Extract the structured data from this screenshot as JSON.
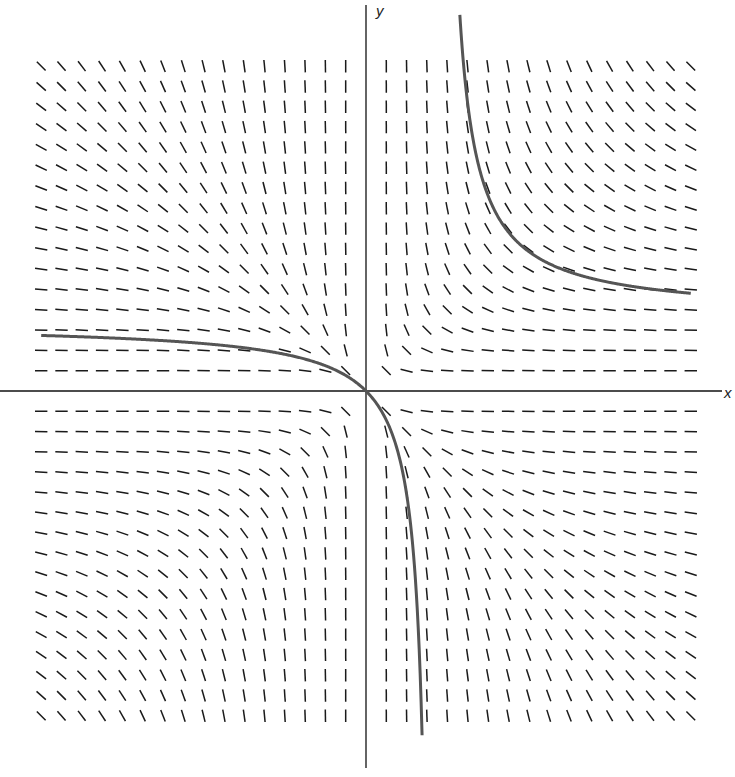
{
  "chart_data": {
    "type": "slope_field",
    "title": "",
    "xlabel": "x",
    "ylabel": "y",
    "differential_equation": "dy/dx = -y^2/x^2",
    "grid": {
      "x_values": [
        -16,
        -15,
        -14,
        -13,
        -12,
        -11,
        -10,
        -9,
        -8,
        -7,
        -6,
        -5,
        -4,
        -3,
        -2,
        -1,
        1,
        2,
        3,
        4,
        5,
        6,
        7,
        8,
        9,
        10,
        11,
        12,
        13,
        14,
        15,
        16
      ],
      "y_values": [
        -16,
        -15,
        -14,
        -13,
        -12,
        -11,
        -10,
        -9,
        -8,
        -7,
        -6,
        -5,
        -4,
        -3,
        -2,
        -1,
        1,
        2,
        3,
        4,
        5,
        6,
        7,
        8,
        9,
        10,
        11,
        12,
        13,
        14,
        15,
        16
      ],
      "note": "grid in equal step units on both axes; no tick labels shown"
    },
    "xlim": [
      -18,
      18.5
    ],
    "ylim": [
      -18.5,
      19
    ],
    "series": [
      {
        "name": "solution through origin",
        "formula": "y = a*x/(x-a)",
        "a": 3.3,
        "x_range": [
          -16,
          3.0
        ],
        "description": "approaches y≈3 as x→-∞, passes through origin, drops steeply toward vertical asymptote x≈3.3"
      },
      {
        "name": "upper-right solution",
        "formula": "y = b*x/(x-b)",
        "b": 3.7,
        "x_range": [
          4.45,
          16
        ],
        "description": "descends from top near x≈4.5, levels toward y≈4.7 at right edge"
      }
    ],
    "colors": {
      "segments": "#1a1a1a",
      "axes": "#111111",
      "curves": "#555555"
    }
  },
  "labels": {
    "x_axis": "x",
    "y_axis": "y"
  }
}
